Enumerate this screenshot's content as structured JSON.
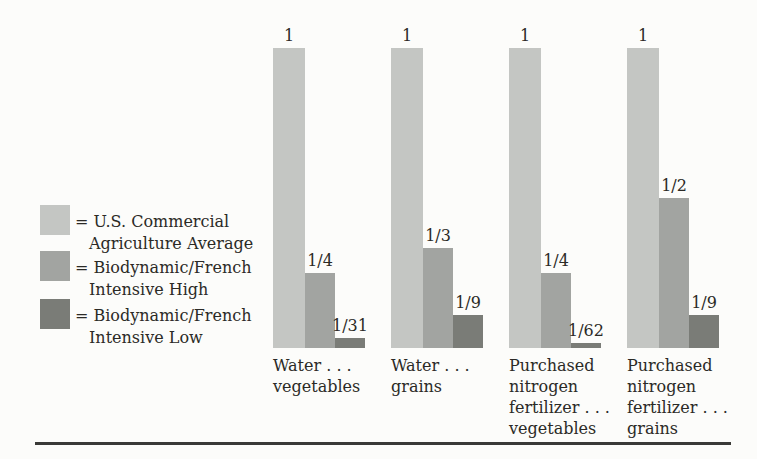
{
  "colors": {
    "background": "#fcfcfa",
    "text": "#2b2a26",
    "us_commercial": "#c4c6c3",
    "biodynamic_high": "#a2a4a1",
    "biodynamic_low": "#7a7c77",
    "rule": "#3a3a37"
  },
  "legend": {
    "items": [
      {
        "swatch_color": "#c4c6c3",
        "line1": "= U.S. Commercial",
        "line2": "Agriculture Average"
      },
      {
        "swatch_color": "#a2a4a1",
        "line1": "= Biodynamic/French",
        "line2": "Intensive High"
      },
      {
        "swatch_color": "#7a7c77",
        "line1": "= Biodynamic/French",
        "line2": "Intensive Low"
      }
    ]
  },
  "chart_data": {
    "type": "bar",
    "title": "",
    "xlabel": "",
    "ylabel": "",
    "ylim": [
      0,
      1
    ],
    "grid": false,
    "legend_position": "left",
    "note": "values are ratios relative to U.S. Commercial Agriculture Average = 1",
    "categories": [
      {
        "label_lines": [
          "Water . . .",
          "vegetables"
        ]
      },
      {
        "label_lines": [
          "Water . . .",
          "grains"
        ]
      },
      {
        "label_lines": [
          "Purchased",
          "nitrogen",
          "fertilizer . . .",
          "vegetables"
        ]
      },
      {
        "label_lines": [
          "Purchased",
          "nitrogen",
          "fertilizer . . .",
          "grains"
        ]
      }
    ],
    "series": [
      {
        "name": "U.S. Commercial Agriculture Average",
        "color": "#c4c6c3",
        "values": [
          1,
          1,
          1,
          1
        ],
        "labels": [
          "1",
          "1",
          "1",
          "1"
        ]
      },
      {
        "name": "Biodynamic/French Intensive High",
        "color": "#a2a4a1",
        "values": [
          0.25,
          0.3333,
          0.25,
          0.5
        ],
        "labels": [
          "1/4",
          "1/3",
          "1/4",
          "1/2"
        ]
      },
      {
        "name": "Biodynamic/French Intensive Low",
        "color": "#7a7c77",
        "values": [
          0.0323,
          0.1111,
          0.0161,
          0.1111
        ],
        "labels": [
          "1/31",
          "1/9",
          "1/62",
          "1/9"
        ]
      }
    ]
  }
}
